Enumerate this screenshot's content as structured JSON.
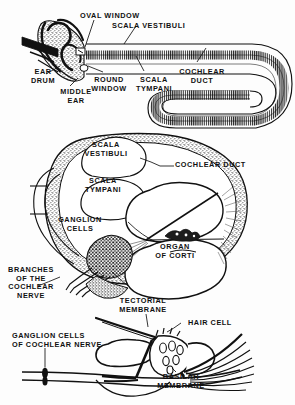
{
  "figure": {
    "background_color": "#fdfdfd",
    "ink_color": "#111111",
    "panels": [
      {
        "name": "uncoiled-cochlea",
        "description": "Outer/middle ear with uncoiled cochlear spiral"
      },
      {
        "name": "cochlea-cross-section",
        "description": "Cross section through one turn of the cochlea"
      },
      {
        "name": "organ-of-corti-detail",
        "description": "Enlarged detail of the organ of Corti"
      }
    ]
  },
  "labels": {
    "oval_window": "OVAL WINDOW",
    "scala_vestibuli_top": "SCALA VESTIBULI",
    "ear_drum": "EAR\nDRUM",
    "middle_ear": "MIDDLE\nEAR",
    "round_window": "ROUND\nWINDOW",
    "scala_tympani_top": "SCALA\nTYMPANI",
    "cochlear_duct_top": "COCHLEAR\nDUCT",
    "scala_vestibuli_mid": "SCALA\nVESTIBULI",
    "cochlear_duct_mid": "COCHLEAR DUCT",
    "scala_tympani_mid": "SCALA\nTYMPANI",
    "ganglion_cells": "GANGLION\nCELLS",
    "organ_of_corti": "ORGAN\nOF CORTI",
    "branches_of_cochlear_nerve": "BRANCHES\nOF THE\nCOCHLEAR\nNERVE",
    "tectorial_membrane": "TECTORIAL\nMEMBRANE",
    "hair_cell": "HAIR CELL",
    "ganglion_cells_of_cochlear_nerve": "GANGLION CELLS\nOF COCHLEAR NERVE",
    "basilar_membrane": "BASILAR\nMEMBRANE"
  }
}
